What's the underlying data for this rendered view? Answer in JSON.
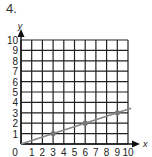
{
  "problem": {
    "number": "4."
  },
  "chart_data": {
    "type": "line",
    "title": "",
    "xlabel": "x",
    "ylabel": "y",
    "xlim": [
      0,
      10
    ],
    "ylim": [
      0,
      10
    ],
    "grid": true,
    "x_ticks": [
      "0",
      "1",
      "2",
      "3",
      "4",
      "5",
      "6",
      "7",
      "8",
      "9",
      "10"
    ],
    "y_ticks": [
      "1",
      "2",
      "3",
      "4",
      "5",
      "6",
      "7",
      "8",
      "9",
      "10"
    ],
    "series": [
      {
        "name": "line",
        "x": [
          0,
          3,
          6,
          9
        ],
        "y": [
          0,
          1,
          2,
          3
        ],
        "marked_points": [
          [
            3,
            1
          ],
          [
            6,
            2
          ],
          [
            9,
            3
          ]
        ],
        "slope": 0.3333,
        "color": "#888888"
      }
    ]
  }
}
